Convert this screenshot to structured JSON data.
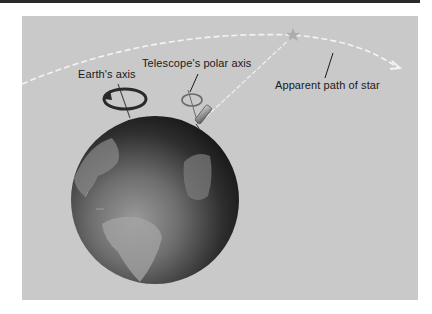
{
  "figure": {
    "type": "illustration",
    "background_color": "#c9c9c9",
    "labels": {
      "earth_axis": "Earth's axis",
      "telescope_polar_axis": "Telescope's polar axis",
      "apparent_path": "Apparent path of star"
    },
    "elements": {
      "globe": "earth-globe",
      "star": "star-icon",
      "telescope": "telescope-icon",
      "earth_rotation_arrow": "rotation-arrow-icon",
      "telescope_rotation_ring": "rotation-ring-icon",
      "star_path": "dashed-arc-arrow"
    },
    "colors": {
      "path_line": "#ffffff",
      "globe_dark": "#141414",
      "globe_light": "#8a8a8a",
      "text": "#1a1a1a"
    }
  }
}
